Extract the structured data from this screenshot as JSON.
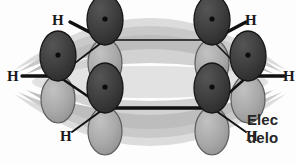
{
  "caption": {
    "line1": "Elec",
    "line2": "delo",
    "full_truncated_text": "Elec delo",
    "note": "caption text is clipped by the right edge of the image"
  },
  "colors": {
    "background": "#fdfdfd",
    "upper_lobe": "#3a3a3a",
    "upper_lobe_outline": "#1c1c1c",
    "lower_lobe": "#a9a9a9",
    "lower_lobe_outline": "#5d5d5d",
    "nucleus_dot": "#111111",
    "bond": "#111111",
    "pi_cloud_dark": "#bcbcbc",
    "pi_cloud_light": "#d5d5d5",
    "pi_cloud_pale": "#e6e6e6",
    "caption_text": "#262626",
    "h_label": "#1a1a1a"
  },
  "atoms": {
    "carbon_count": 6,
    "hydrogen_count": 6,
    "carbons": [
      {
        "id": "C1",
        "position": "top-left",
        "x": 105,
        "y": 40
      },
      {
        "id": "C2",
        "position": "top-right",
        "x": 212,
        "y": 40
      },
      {
        "id": "C3",
        "position": "middle-right",
        "x": 248,
        "y": 76
      },
      {
        "id": "C4",
        "position": "bottom-right",
        "x": 212,
        "y": 108
      },
      {
        "id": "C5",
        "position": "bottom-left",
        "x": 105,
        "y": 108
      },
      {
        "id": "C6",
        "position": "middle-left",
        "x": 58,
        "y": 76
      }
    ],
    "hydrogens": [
      {
        "id": "H1",
        "label": "H",
        "position": "top-left",
        "x": 57,
        "y": 17
      },
      {
        "id": "H2",
        "label": "H",
        "position": "top-right",
        "x": 217,
        "y": 15
      },
      {
        "id": "H3",
        "label": "H",
        "position": "right",
        "x": 262,
        "y": 74
      },
      {
        "id": "H4",
        "label": "H",
        "position": "bottom-right",
        "x": 218,
        "y": 130
      },
      {
        "id": "H5",
        "label": "H",
        "position": "bottom-left",
        "x": 55,
        "y": 130
      },
      {
        "id": "H6",
        "label": "H",
        "position": "left",
        "x": 6,
        "y": 71
      }
    ]
  },
  "orbitals": {
    "type": "p-orbital",
    "lobes_per_atom": 2,
    "upper_lobe_label": "upper p lobe",
    "lower_lobe_label": "lower p lobe",
    "nucleus_marker": "dot"
  },
  "pi_system": {
    "label": "delocalized pi electron cloud",
    "bands": 2,
    "band_positions": [
      "above ring plane",
      "below ring plane"
    ]
  }
}
